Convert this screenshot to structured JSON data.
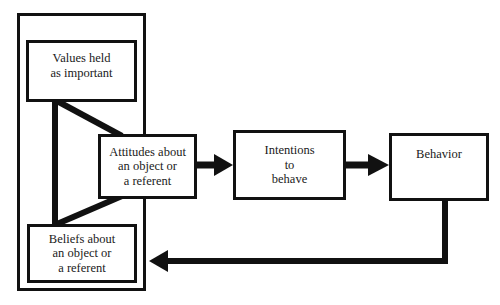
{
  "diagram": {
    "type": "flow",
    "nodes": {
      "values": {
        "lines": [
          "Values held",
          "as important"
        ]
      },
      "attitudes": {
        "lines": [
          "Attitudes about",
          "an object or",
          "a referent"
        ]
      },
      "beliefs": {
        "lines": [
          "Beliefs about",
          "an object or",
          "a referent"
        ]
      },
      "intentions": {
        "lines": [
          "Intentions",
          "to",
          "behave"
        ]
      },
      "behavior": {
        "lines": [
          "Behavior"
        ]
      }
    },
    "edges": [
      {
        "from": "values",
        "to": "attitudes",
        "style": "line"
      },
      {
        "from": "values",
        "to": "beliefs",
        "style": "line"
      },
      {
        "from": "beliefs",
        "to": "attitudes",
        "style": "line"
      },
      {
        "from": "attitudes",
        "to": "intentions",
        "style": "arrow"
      },
      {
        "from": "intentions",
        "to": "behavior",
        "style": "arrow"
      },
      {
        "from": "behavior",
        "to": "beliefs",
        "style": "arrow"
      }
    ],
    "colors": {
      "stroke": "#111111",
      "background": "#ffffff"
    }
  }
}
